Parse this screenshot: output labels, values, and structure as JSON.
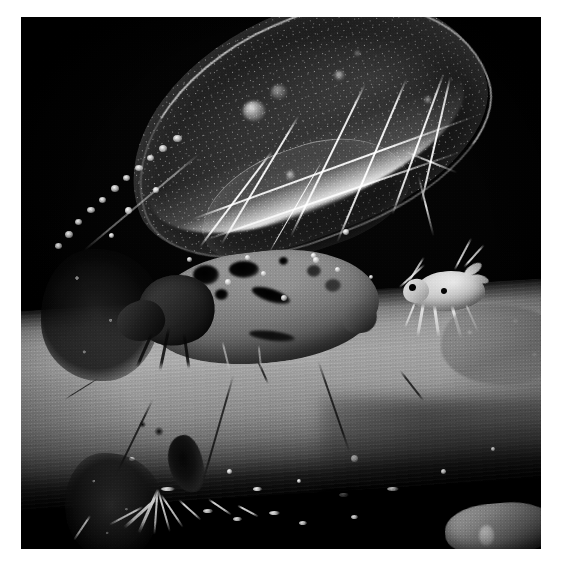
{
  "page": {
    "background_color": "#ffffff",
    "width": 562,
    "height": 570
  },
  "photo": {
    "title": "Winged aphid and nymph on plant stem",
    "description": "Black-and-white macro photograph of an alate (winged) aphid resting on a plant stem, with a smaller pale aphid nymph standing to its right. The large translucent forewing with branching veins dominates the upper portion of the frame against a black background.",
    "color_mode": "black-and-white",
    "frame": {
      "left": 21,
      "top": 17,
      "width": 520,
      "height": 532,
      "border_color": "#ffffff",
      "background_color": "#000000"
    },
    "palette": {
      "background": "#000000",
      "stem_midtone": "#9a9a9a",
      "stem_shadow": "#1d1d1e",
      "wing_membrane": "#242426",
      "wing_vein_highlight": "#ffffff",
      "aphid_body": "#7e7e7e",
      "aphid_spots": "#050505",
      "nymph_body": "#dedede"
    },
    "subjects": [
      {
        "name": "winged-aphid",
        "label": "Winged aphid (alate)",
        "position": "center-left"
      },
      {
        "name": "forewing",
        "label": "Translucent forewing with branching veins",
        "position": "upper-right"
      },
      {
        "name": "aphid-nymph",
        "label": "Pale aphid nymph",
        "position": "right of centre"
      },
      {
        "name": "plant-stem",
        "label": "Plant stem",
        "position": "lower third, diagonal"
      },
      {
        "name": "antenna",
        "label": "Segmented antenna with pale banding",
        "position": "upper-left"
      },
      {
        "name": "debris-cluster",
        "label": "Wax debris and trichomes",
        "position": "lower-left"
      },
      {
        "name": "scale-insect",
        "label": "Pale insect remnant on stem",
        "position": "lower-right"
      }
    ]
  }
}
